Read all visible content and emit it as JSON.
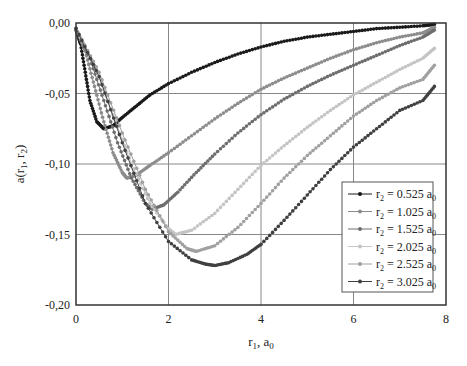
{
  "chart_data": {
    "type": "scatter",
    "title": "",
    "xlabel": "r1, a0",
    "ylabel": "a(r1, r2)",
    "xlim": [
      0,
      8
    ],
    "ylim": [
      -0.2,
      0.0
    ],
    "x_ticks": [
      "0",
      "2",
      "4",
      "6",
      "8"
    ],
    "y_ticks": [
      "0,00",
      "-0,05",
      "-0,10",
      "-0,15",
      "-0,20"
    ],
    "grid": true,
    "legend_position": "lower right (inside)",
    "series": [
      {
        "name": "r2 = 0.525 a0",
        "color": "#1a1a1a",
        "x": [
          0,
          0.1,
          0.2,
          0.3,
          0.45,
          0.6,
          0.8,
          1.0,
          1.3,
          1.6,
          2.0,
          2.5,
          3.0,
          3.5,
          4.0,
          4.5,
          5.0,
          5.5,
          6.0,
          6.5,
          7.0,
          7.5,
          7.75
        ],
        "y": [
          -0.005,
          -0.015,
          -0.035,
          -0.055,
          -0.07,
          -0.075,
          -0.073,
          -0.067,
          -0.059,
          -0.051,
          -0.043,
          -0.035,
          -0.028,
          -0.022,
          -0.017,
          -0.013,
          -0.01,
          -0.008,
          -0.006,
          -0.004,
          -0.003,
          -0.002,
          -0.001
        ]
      },
      {
        "name": "r2 = 1.025 a0",
        "color": "#8c8c8c",
        "x": [
          0,
          0.2,
          0.4,
          0.6,
          0.8,
          1.0,
          1.1,
          1.3,
          1.6,
          2.0,
          2.5,
          3.0,
          3.5,
          4.0,
          4.5,
          5.0,
          5.5,
          6.0,
          6.5,
          7.0,
          7.5,
          7.75
        ],
        "y": [
          -0.004,
          -0.02,
          -0.045,
          -0.07,
          -0.092,
          -0.106,
          -0.11,
          -0.108,
          -0.101,
          -0.092,
          -0.08,
          -0.068,
          -0.057,
          -0.047,
          -0.039,
          -0.032,
          -0.025,
          -0.019,
          -0.014,
          -0.01,
          -0.007,
          -0.003
        ]
      },
      {
        "name": "r2 = 1.525 a0",
        "color": "#6e6e6e",
        "x": [
          0,
          0.3,
          0.6,
          0.9,
          1.2,
          1.5,
          1.65,
          1.9,
          2.2,
          2.6,
          3.0,
          3.5,
          4.0,
          4.5,
          5.0,
          5.5,
          6.0,
          6.5,
          7.0,
          7.5,
          7.75
        ],
        "y": [
          -0.004,
          -0.025,
          -0.055,
          -0.085,
          -0.11,
          -0.128,
          -0.132,
          -0.129,
          -0.12,
          -0.106,
          -0.093,
          -0.078,
          -0.065,
          -0.054,
          -0.045,
          -0.037,
          -0.03,
          -0.023,
          -0.016,
          -0.01,
          -0.005
        ]
      },
      {
        "name": "r2 = 2.025 a0",
        "color": "#c4c4c4",
        "x": [
          0,
          0.4,
          0.8,
          1.2,
          1.6,
          2.0,
          2.15,
          2.5,
          3.0,
          3.5,
          4.0,
          4.5,
          5.0,
          5.5,
          6.0,
          6.5,
          7.0,
          7.5,
          7.75
        ],
        "y": [
          -0.004,
          -0.03,
          -0.065,
          -0.1,
          -0.128,
          -0.146,
          -0.15,
          -0.147,
          -0.135,
          -0.118,
          -0.101,
          -0.087,
          -0.074,
          -0.062,
          -0.051,
          -0.042,
          -0.033,
          -0.025,
          -0.018
        ]
      },
      {
        "name": "r2 = 2.525 a0",
        "color": "#a0a0a0",
        "x": [
          0,
          0.5,
          1.0,
          1.5,
          2.0,
          2.4,
          2.6,
          3.0,
          3.5,
          4.0,
          4.5,
          5.0,
          5.5,
          6.0,
          6.5,
          7.0,
          7.5,
          7.75
        ],
        "y": [
          -0.004,
          -0.035,
          -0.078,
          -0.118,
          -0.148,
          -0.16,
          -0.162,
          -0.158,
          -0.145,
          -0.128,
          -0.11,
          -0.094,
          -0.08,
          -0.066,
          -0.055,
          -0.046,
          -0.04,
          -0.03
        ]
      },
      {
        "name": "r2 = 3.025 a0",
        "color": "#404040",
        "x": [
          0,
          0.5,
          1.0,
          1.5,
          2.0,
          2.5,
          2.8,
          3.0,
          3.3,
          3.7,
          4.0,
          4.5,
          5.0,
          5.5,
          6.0,
          6.5,
          7.0,
          7.5,
          7.75
        ],
        "y": [
          -0.004,
          -0.038,
          -0.085,
          -0.128,
          -0.155,
          -0.168,
          -0.171,
          -0.172,
          -0.17,
          -0.164,
          -0.157,
          -0.14,
          -0.122,
          -0.104,
          -0.088,
          -0.075,
          -0.062,
          -0.055,
          -0.045
        ]
      }
    ]
  },
  "legend": {
    "items": [
      {
        "label": "r",
        "sub": "2",
        "rest": " = 0.525 a",
        "sub2": "0"
      },
      {
        "label": "r",
        "sub": "2",
        "rest": " = 1.025 a",
        "sub2": "0"
      },
      {
        "label": "r",
        "sub": "2",
        "rest": " = 1.525 a",
        "sub2": "0"
      },
      {
        "label": "r",
        "sub": "2",
        "rest": " = 2.025 a",
        "sub2": "0"
      },
      {
        "label": "r",
        "sub": "2",
        "rest": " = 2.525 a",
        "sub2": "0"
      },
      {
        "label": "r",
        "sub": "2",
        "rest": " = 3.025 a",
        "sub2": "0"
      }
    ]
  },
  "axes": {
    "xlabel_main": "r",
    "xlabel_sub": "1",
    "xlabel_rest": ", a",
    "xlabel_sub2": "0",
    "ylabel_main": "a(r",
    "ylabel_sub1": "1",
    "ylabel_mid": ", r",
    "ylabel_sub2": "2",
    "ylabel_end": ")"
  }
}
